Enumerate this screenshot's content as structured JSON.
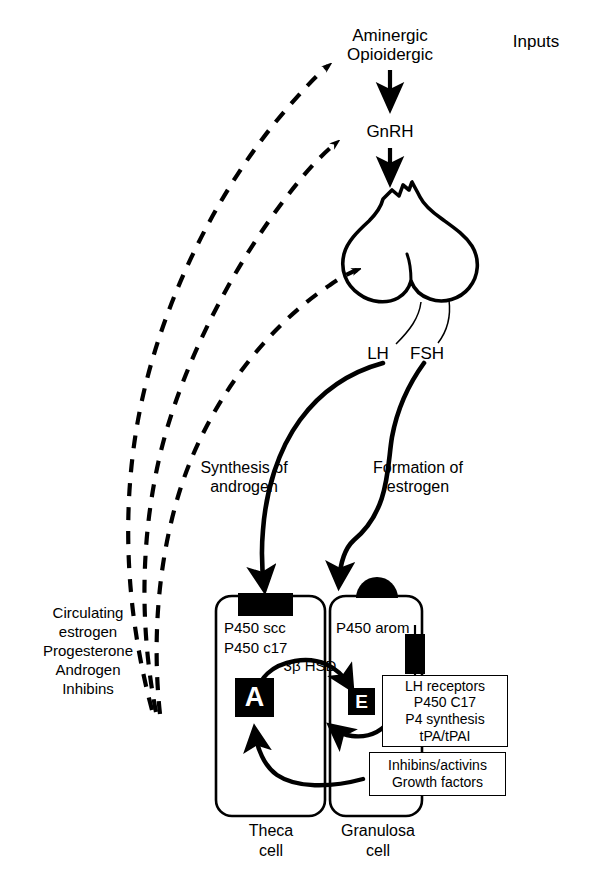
{
  "figure": {
    "ink_color": "#000000",
    "background_color": "#ffffff"
  },
  "nodes": {
    "inputs_label": "Inputs",
    "hypothalamus_line1": "Aminergic",
    "hypothalamus_line2": "Opioidergic",
    "gnrh": "GnRH",
    "lh": "LH",
    "fsh": "FSH",
    "pathway_left_line1": "Synthesis of",
    "pathway_left_line2": "androgen",
    "pathway_right_line1": "Formation of",
    "pathway_right_line2": "estrogen",
    "androgen_symbol": "A",
    "estrogen_symbol": "E",
    "hsd_label": "3β HSD",
    "theca_cell_line1": "Theca",
    "theca_cell_line2": "cell",
    "granulosa_cell_line1": "Granulosa",
    "granulosa_cell_line2": "cell"
  },
  "theca_enzymes": {
    "line1": "P450 scc",
    "line2": "P450 c17"
  },
  "granulosa_enzymes": {
    "line1": "P450 arom"
  },
  "fsh_actions_box": {
    "lines": [
      "LH receptors",
      "P450 C17",
      "P4 synthesis",
      "tPA/tPAI"
    ]
  },
  "granulosa_products_box": {
    "lines": [
      "Inhibins/activins",
      "Growth factors"
    ]
  },
  "feedback": {
    "lines": [
      "Circulating",
      "estrogen",
      "Progesterone",
      "Androgen",
      "Inhibins"
    ]
  },
  "icons": {
    "theca_receptor": "rectangular-receptor-icon",
    "granulosa_receptor": "dome-receptor-icon",
    "lh_receptor": "lh-receptor-icon",
    "pituitary": "pituitary-gland-icon"
  }
}
